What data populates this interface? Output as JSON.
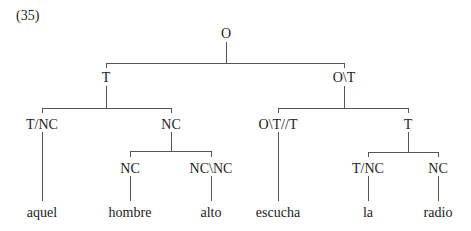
{
  "example_number": "(35)",
  "tree": {
    "nodes": [
      {
        "id": "root",
        "label": "O",
        "x": 226,
        "y": 38,
        "kind": "category"
      },
      {
        "id": "t",
        "label": "T",
        "x": 106,
        "y": 82,
        "kind": "category"
      },
      {
        "id": "ot",
        "label": "O\\T",
        "x": 344,
        "y": 82,
        "kind": "category"
      },
      {
        "id": "tnc1",
        "label": "T/NC",
        "x": 42,
        "y": 129,
        "kind": "category"
      },
      {
        "id": "nc1",
        "label": "NC",
        "x": 171,
        "y": 129,
        "kind": "category"
      },
      {
        "id": "ott",
        "label": "O\\T//T",
        "x": 278,
        "y": 129,
        "kind": "category"
      },
      {
        "id": "t2",
        "label": "T",
        "x": 408,
        "y": 129,
        "kind": "category"
      },
      {
        "id": "nc2",
        "label": "NC",
        "x": 130,
        "y": 173,
        "kind": "category"
      },
      {
        "id": "ncnc",
        "label": "NC\\NC",
        "x": 211,
        "y": 173,
        "kind": "category"
      },
      {
        "id": "tnc2",
        "label": "T/NC",
        "x": 368,
        "y": 173,
        "kind": "category"
      },
      {
        "id": "nc3",
        "label": "NC",
        "x": 438,
        "y": 173,
        "kind": "category"
      },
      {
        "id": "w1",
        "label": "aquel",
        "x": 42,
        "y": 217,
        "kind": "word"
      },
      {
        "id": "w2",
        "label": "hombre",
        "x": 130,
        "y": 217,
        "kind": "word"
      },
      {
        "id": "w3",
        "label": "alto",
        "x": 211,
        "y": 217,
        "kind": "word"
      },
      {
        "id": "w4",
        "label": "escucha",
        "x": 278,
        "y": 217,
        "kind": "word"
      },
      {
        "id": "w5",
        "label": "la",
        "x": 368,
        "y": 217,
        "kind": "word"
      },
      {
        "id": "w6",
        "label": "radio",
        "x": 438,
        "y": 217,
        "kind": "word"
      }
    ],
    "edges": [
      {
        "from": "root",
        "to": [
          "t",
          "ot"
        ],
        "parent_bottom": 42,
        "bar_y": 63,
        "child_top": 68
      },
      {
        "from": "t",
        "to": [
          "tnc1",
          "nc1"
        ],
        "parent_bottom": 86,
        "bar_y": 108,
        "child_top": 113
      },
      {
        "from": "ot",
        "to": [
          "ott",
          "t2"
        ],
        "parent_bottom": 86,
        "bar_y": 108,
        "child_top": 113
      },
      {
        "from": "nc1",
        "to": [
          "nc2",
          "ncnc"
        ],
        "parent_bottom": 132,
        "bar_y": 151,
        "child_top": 157
      },
      {
        "from": "t2",
        "to": [
          "tnc2",
          "nc3"
        ],
        "parent_bottom": 132,
        "bar_y": 152,
        "child_top": 157
      },
      {
        "from": "tnc1",
        "to": [
          "w1"
        ],
        "parent_bottom": 132,
        "bar_y": null,
        "child_top": 201
      },
      {
        "from": "ott",
        "to": [
          "w4"
        ],
        "parent_bottom": 132,
        "bar_y": null,
        "child_top": 201
      },
      {
        "from": "nc2",
        "to": [
          "w2"
        ],
        "parent_bottom": 176,
        "bar_y": null,
        "child_top": 201
      },
      {
        "from": "ncnc",
        "to": [
          "w3"
        ],
        "parent_bottom": 176,
        "bar_y": null,
        "child_top": 201
      },
      {
        "from": "tnc2",
        "to": [
          "w5"
        ],
        "parent_bottom": 176,
        "bar_y": null,
        "child_top": 201
      },
      {
        "from": "nc3",
        "to": [
          "w6"
        ],
        "parent_bottom": 176,
        "bar_y": null,
        "child_top": 201
      }
    ]
  }
}
